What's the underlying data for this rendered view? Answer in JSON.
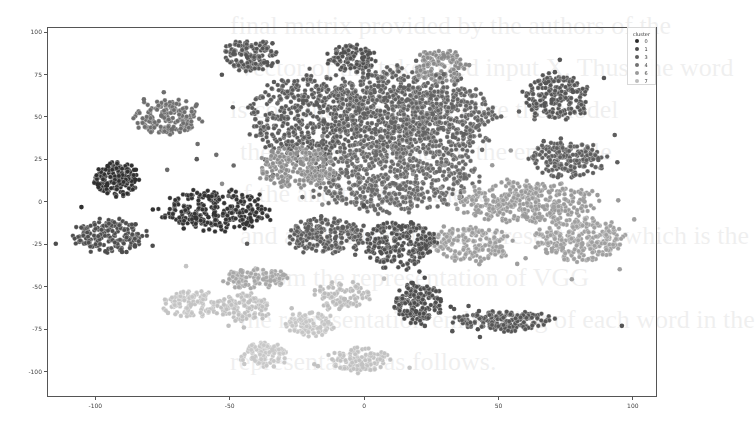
{
  "chart_data": {
    "type": "scatter",
    "title": "",
    "xlabel": "",
    "ylabel": "",
    "xlim": [
      -118,
      109
    ],
    "ylim": [
      -115,
      103
    ],
    "x_ticks": [
      -100,
      -50,
      0,
      50,
      100
    ],
    "x_tick_labels": [
      "-100",
      "-50",
      "0",
      "50",
      "100"
    ],
    "y_ticks": [
      100,
      75,
      50,
      25,
      0,
      -25,
      -50,
      -75,
      -100
    ],
    "y_tick_labels": [
      "100",
      "75",
      "50",
      "25",
      "0",
      "-25",
      "-50",
      "-75",
      "-100"
    ],
    "grid": false,
    "legend": {
      "title": "cluster",
      "position": "upper right",
      "entries": [
        {
          "label": "0",
          "color": "#2b2b2b"
        },
        {
          "label": "1",
          "color": "#4a4a4a"
        },
        {
          "label": "3",
          "color": "#5e5e5e"
        },
        {
          "label": "4",
          "color": "#727272"
        },
        {
          "label": "6",
          "color": "#9a9a9a"
        },
        {
          "label": "7",
          "color": "#bdbdbd"
        }
      ]
    },
    "clusters": [
      {
        "cluster": "1",
        "cx": -42,
        "cy": 86,
        "rx": 10,
        "ry": 9,
        "n": 140,
        "color": "#555555"
      },
      {
        "cluster": "4",
        "cx": -73,
        "cy": 50,
        "rx": 12,
        "ry": 10,
        "n": 170,
        "color": "#6e6e6e"
      },
      {
        "cluster": "0",
        "cx": -92,
        "cy": 13,
        "rx": 9,
        "ry": 10,
        "n": 150,
        "color": "#2f2f2f"
      },
      {
        "cluster": "1",
        "cx": -95,
        "cy": -20,
        "rx": 13,
        "ry": 10,
        "n": 170,
        "color": "#4d4d4d"
      },
      {
        "cluster": "0",
        "cx": -55,
        "cy": -5,
        "rx": 20,
        "ry": 12,
        "n": 260,
        "color": "#333333"
      },
      {
        "cluster": "3",
        "cx": -20,
        "cy": 50,
        "rx": 22,
        "ry": 25,
        "n": 520,
        "color": "#5a5a5a"
      },
      {
        "cluster": "3",
        "cx": 10,
        "cy": 55,
        "rx": 20,
        "ry": 25,
        "n": 480,
        "color": "#606060"
      },
      {
        "cluster": "1",
        "cx": -5,
        "cy": 85,
        "rx": 9,
        "ry": 8,
        "n": 110,
        "color": "#505050"
      },
      {
        "cluster": "6",
        "cx": 28,
        "cy": 80,
        "rx": 10,
        "ry": 10,
        "n": 120,
        "color": "#8a8a8a"
      },
      {
        "cluster": "3",
        "cx": 30,
        "cy": 50,
        "rx": 18,
        "ry": 22,
        "n": 380,
        "color": "#646464"
      },
      {
        "cluster": "4",
        "cx": 10,
        "cy": 15,
        "rx": 30,
        "ry": 20,
        "n": 620,
        "color": "#6a6a6a"
      },
      {
        "cluster": "6",
        "cx": -25,
        "cy": 20,
        "rx": 14,
        "ry": 12,
        "n": 200,
        "color": "#8d8d8d"
      },
      {
        "cluster": "1",
        "cx": 72,
        "cy": 62,
        "rx": 12,
        "ry": 13,
        "n": 200,
        "color": "#555555"
      },
      {
        "cluster": "3",
        "cx": 75,
        "cy": 25,
        "rx": 14,
        "ry": 10,
        "n": 180,
        "color": "#5e5e5e"
      },
      {
        "cluster": "6",
        "cx": 60,
        "cy": 0,
        "rx": 25,
        "ry": 12,
        "n": 360,
        "color": "#9a9a9a"
      },
      {
        "cluster": "6",
        "cx": 80,
        "cy": -22,
        "rx": 16,
        "ry": 13,
        "n": 260,
        "color": "#a0a0a0"
      },
      {
        "cluster": "6",
        "cx": 40,
        "cy": -25,
        "rx": 14,
        "ry": 10,
        "n": 170,
        "color": "#9e9e9e"
      },
      {
        "cluster": "1",
        "cx": 12,
        "cy": -25,
        "rx": 14,
        "ry": 14,
        "n": 240,
        "color": "#4f4f4f"
      },
      {
        "cluster": "1",
        "cx": 20,
        "cy": -60,
        "rx": 9,
        "ry": 12,
        "n": 160,
        "color": "#4c4c4c"
      },
      {
        "cluster": "1",
        "cx": 52,
        "cy": -70,
        "rx": 18,
        "ry": 6,
        "n": 180,
        "color": "#555555"
      },
      {
        "cluster": "3",
        "cx": -15,
        "cy": -20,
        "rx": 14,
        "ry": 10,
        "n": 200,
        "color": "#5c5c5c"
      },
      {
        "cluster": "7",
        "cx": -65,
        "cy": -60,
        "rx": 10,
        "ry": 8,
        "n": 110,
        "color": "#c4c4c4"
      },
      {
        "cluster": "7",
        "cx": -45,
        "cy": -62,
        "rx": 10,
        "ry": 8,
        "n": 110,
        "color": "#c0c0c0"
      },
      {
        "cluster": "7",
        "cx": -20,
        "cy": -72,
        "rx": 9,
        "ry": 7,
        "n": 100,
        "color": "#c6c6c6"
      },
      {
        "cluster": "7",
        "cx": -37,
        "cy": -90,
        "rx": 9,
        "ry": 7,
        "n": 100,
        "color": "#c8c8c8"
      },
      {
        "cluster": "7",
        "cx": -2,
        "cy": -93,
        "rx": 11,
        "ry": 7,
        "n": 110,
        "color": "#c2c2c2"
      },
      {
        "cluster": "7",
        "cx": -8,
        "cy": -55,
        "rx": 10,
        "ry": 8,
        "n": 100,
        "color": "#bcbcbc"
      },
      {
        "cluster": "6",
        "cx": -40,
        "cy": -45,
        "rx": 12,
        "ry": 6,
        "n": 110,
        "color": "#a8a8a8"
      }
    ]
  },
  "bleed_text": [
    "final matrix provided by the authors of the",
    "vector of the tokenized input X. Thus, the word",
    "is computed to which have the model",
    "the model bring about the ensemble",
    "of the and the to in the it",
    "and a tokenized input representation which is the",
    "... from the representation of VGG",
    "the representation embedding of each word in the",
    "representation as follows."
  ]
}
